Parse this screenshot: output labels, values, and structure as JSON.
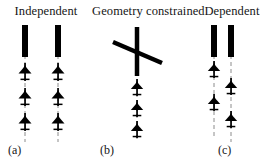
{
  "figure": {
    "type": "diagram",
    "background_color": "#ffffff",
    "ink_color": "#000000",
    "approach_path_color": "#888888"
  },
  "panels": [
    {
      "id": "a",
      "title": "Independent",
      "caption": "(a)",
      "runways": [
        {
          "name": "runway-left",
          "orientation": "vertical"
        },
        {
          "name": "runway-right",
          "orientation": "vertical"
        }
      ],
      "approach_paths": 2,
      "aircraft_count": 6,
      "aircraft_per_path": 3
    },
    {
      "id": "b",
      "title": "Geometry constrained",
      "caption": "(b)",
      "runways": [
        {
          "name": "runway-vertical",
          "orientation": "vertical"
        },
        {
          "name": "runway-crossing",
          "orientation": "diagonal"
        }
      ],
      "approach_paths": 1,
      "aircraft_count": 3,
      "aircraft_per_path": 3
    },
    {
      "id": "c",
      "title": "Dependent",
      "caption": "(c)",
      "runways": [
        {
          "name": "runway-left",
          "orientation": "vertical"
        },
        {
          "name": "runway-right",
          "orientation": "vertical"
        }
      ],
      "approach_paths": 2,
      "aircraft_count": 4,
      "aircraft_per_path": 2,
      "staggered": true
    }
  ]
}
